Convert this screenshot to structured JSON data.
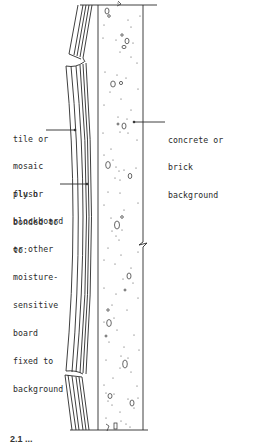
{
  "diagram": {
    "type": "section-drawing",
    "colors": {
      "ink": "#2a2a2a",
      "background": "#ffffff"
    }
  },
  "labels": {
    "tile": {
      "lines": [
        "tile or",
        "mosaic",
        "flush",
        "bonded to",
        "to:"
      ]
    },
    "board": {
      "lines": [
        "ply or",
        "blockboard",
        "or other",
        "moisture-",
        "sensitive",
        "board",
        "fixed to",
        "background"
      ]
    },
    "background": {
      "lines": [
        "concrete or",
        "brick",
        "background"
      ]
    }
  },
  "caption": {
    "text": "2.1 ..."
  }
}
